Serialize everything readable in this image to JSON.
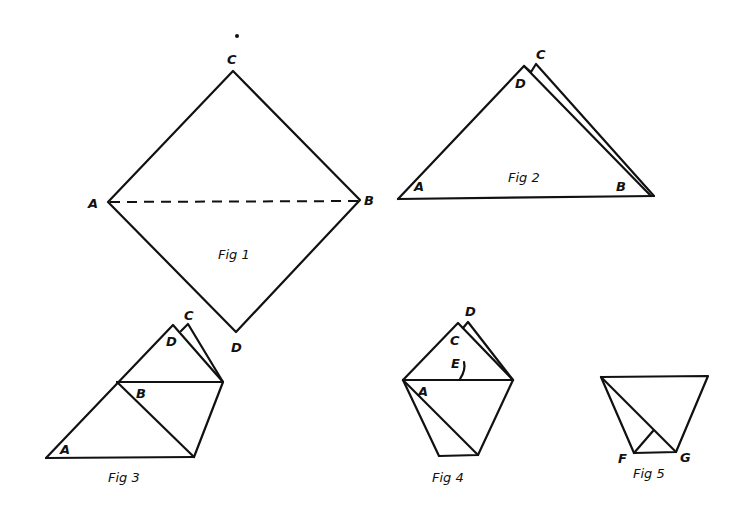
{
  "figures": {
    "fig1": {
      "caption": "Fig 1",
      "labels": {
        "A": "A",
        "B": "B",
        "C": "C",
        "D": "D"
      },
      "description": "Square paper as diamond with dashed fold line A–B"
    },
    "fig2": {
      "caption": "Fig 2",
      "labels": {
        "A": "A",
        "B": "B",
        "C": "C",
        "D": "D"
      },
      "description": "Folded along A–B into triangle; corners C and D near apex"
    },
    "fig3": {
      "caption": "Fig 3",
      "labels": {
        "A": "A",
        "B": "B",
        "C": "C",
        "D": "D"
      },
      "description": "Corner B folded to left side"
    },
    "fig4": {
      "caption": "Fig 4",
      "labels": {
        "A": "A",
        "C": "C",
        "D": "D",
        "E": "E"
      },
      "description": "Corner A folded over to the right"
    },
    "fig5": {
      "caption": "Fig 5",
      "labels": {
        "F": "F",
        "G": "G"
      },
      "description": "Top flaps folded down; trapezoid shape"
    }
  }
}
